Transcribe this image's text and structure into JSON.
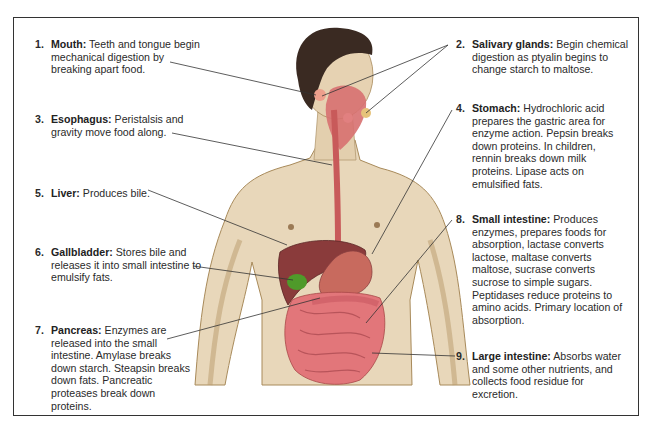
{
  "diagram": {
    "labels": [
      {
        "num": "1.",
        "title": "Mouth:",
        "text": "Teeth and tongue begin mechanical digestion by breaking apart food."
      },
      {
        "num": "2.",
        "title": "Salivary glands:",
        "text": "Begin chemical digestion as ptyalin begins to change starch to maltose."
      },
      {
        "num": "3.",
        "title": "Esophagus:",
        "text": "Peristalsis and gravity move food along."
      },
      {
        "num": "4.",
        "title": "Stomach:",
        "text": "Hydrochloric acid prepares the gastric area for enzyme action. Pepsin breaks down proteins. In children, rennin breaks down milk proteins. Lipase acts on emulsified fats."
      },
      {
        "num": "5.",
        "title": "Liver:",
        "text": "Produces bile."
      },
      {
        "num": "6.",
        "title": "Gallbladder:",
        "text": "Stores bile and releases it into small intestine to emulsify fats."
      },
      {
        "num": "7.",
        "title": "Pancreas:",
        "text": "Enzymes are released into the small intestine. Amylase breaks down starch. Steapsin breaks down fats. Pancreatic proteases break down proteins."
      },
      {
        "num": "8.",
        "title": "Small intestine:",
        "text": "Produces enzymes, prepares foods for absorption, lactase converts lactose, maltase converts maltose, sucrase converts sucrose to simple sugars. Peptidases reduce proteins to amino acids. Primary location of absorption."
      },
      {
        "num": "9.",
        "title": "Large intestine:",
        "text": "Absorbs water and some other nutrients, and collects food residue for excretion."
      }
    ],
    "colors": {
      "skin": "#e6d3b3",
      "skin_shadow": "#b89a6a",
      "hair": "#3a2a22",
      "esophagus": "#c85a5a",
      "liver": "#8a3b3b",
      "gallbladder": "#4f9a2a",
      "stomach": "#c86a5e",
      "intestine": "#e2767a",
      "leader_line": "#333333"
    }
  }
}
